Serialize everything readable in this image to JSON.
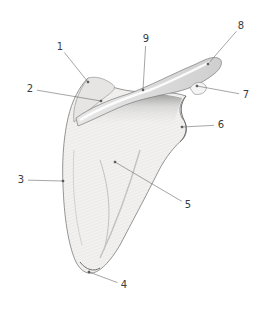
{
  "figure": {
    "colors": {
      "background": "#ffffff",
      "bone_fill": "#f1f0ee",
      "shading": "#9a9a9a",
      "outline": "#6e6e6e",
      "leader_line": "#6a6a6a",
      "label_text": "#3a3a3a"
    },
    "labels": [
      {
        "id": "1",
        "text": "1",
        "x": 60,
        "y": 47,
        "tx": 88,
        "ty": 82
      },
      {
        "id": "2",
        "text": "2",
        "x": 30,
        "y": 89,
        "tx": 101,
        "ty": 101
      },
      {
        "id": "3",
        "text": "3",
        "x": 21,
        "y": 180,
        "tx": 63,
        "ty": 181
      },
      {
        "id": "4",
        "text": "4",
        "x": 124,
        "y": 285,
        "tx": 89,
        "ty": 272
      },
      {
        "id": "5",
        "text": "5",
        "x": 188,
        "y": 205,
        "tx": 115,
        "ty": 162
      },
      {
        "id": "6",
        "text": "6",
        "x": 221,
        "y": 125,
        "tx": 182,
        "ty": 127
      },
      {
        "id": "7",
        "text": "7",
        "x": 246,
        "y": 95,
        "tx": 197,
        "ty": 86
      },
      {
        "id": "8",
        "text": "8",
        "x": 241,
        "y": 26,
        "tx": 208,
        "ty": 64
      },
      {
        "id": "9",
        "text": "9",
        "x": 146,
        "y": 39,
        "tx": 143,
        "ty": 90
      }
    ]
  }
}
